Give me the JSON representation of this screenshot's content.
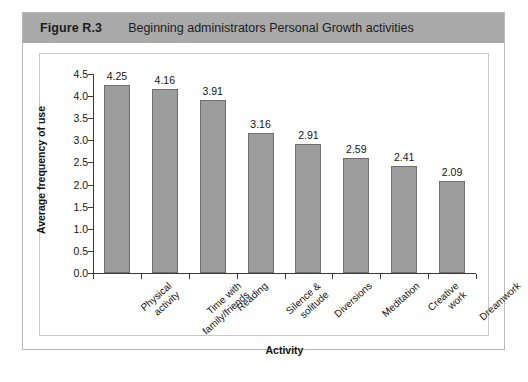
{
  "figure": {
    "number": "Figure R.3",
    "caption": "Beginning administrators Personal Growth activities"
  },
  "chart_data": {
    "type": "bar",
    "title": "Beginning administrators Personal Growth activities",
    "xlabel": "Activity",
    "ylabel": "Average frequency of use",
    "ylim": [
      0.0,
      4.5
    ],
    "yticks": [
      "0.0",
      "0.5",
      "1.0",
      "1.5",
      "2.0",
      "2.5",
      "3.0",
      "3.5",
      "4.0",
      "4.5"
    ],
    "grid": false,
    "legend": false,
    "categories": [
      "Physical activity",
      "Time with family/friends",
      "Reading",
      "Silence & solitude",
      "Diversions",
      "Meditation",
      "Creative work",
      "Dreamwork"
    ],
    "category_lines": [
      [
        "Physical",
        "activity"
      ],
      [
        "Time with",
        "family/friends"
      ],
      [
        "Reading"
      ],
      [
        "Silence &",
        "solitude"
      ],
      [
        "Diversions"
      ],
      [
        "Meditation"
      ],
      [
        "Creative",
        "work"
      ],
      [
        "Dreamwork"
      ]
    ],
    "values": [
      4.25,
      4.16,
      3.91,
      3.16,
      2.91,
      2.59,
      2.41,
      2.09
    ],
    "value_labels": [
      "4.25",
      "4.16",
      "3.91",
      "3.16",
      "2.91",
      "2.59",
      "2.41",
      "2.09"
    ],
    "colors": {
      "bar_fill": "#9d9d9d",
      "bar_border": "#6e6e6e",
      "axis": "#3a3a3a",
      "header_band": "#a9a9a9",
      "frame_border": "#b9b9b9"
    }
  }
}
